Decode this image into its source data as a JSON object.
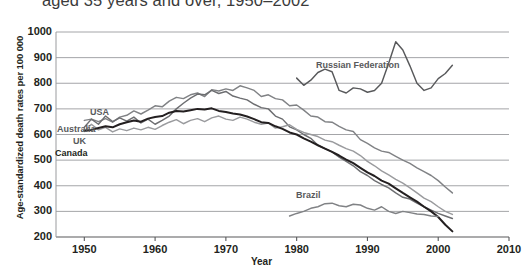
{
  "chart_data": {
    "type": "line",
    "title": "aged 35 years and over, 1950–2002",
    "xlabel": "Year",
    "ylabel": "Age-standardized death rates per 100 000",
    "xlim": [
      1946,
      2010
    ],
    "ylim": [
      200,
      1000
    ],
    "xticks": [
      1950,
      1960,
      1970,
      1980,
      1990,
      2000,
      2010
    ],
    "yticks": [
      200,
      300,
      400,
      500,
      600,
      700,
      800,
      900,
      1000
    ],
    "grid": true,
    "legend_position": "inline-annotations",
    "series": [
      {
        "name": "USA",
        "color": "#808285",
        "label_x": 90,
        "label_y": 107,
        "points": [
          [
            1950,
            655
          ],
          [
            1951,
            660
          ],
          [
            1952,
            650
          ],
          [
            1953,
            662
          ],
          [
            1954,
            648
          ],
          [
            1955,
            668
          ],
          [
            1956,
            675
          ],
          [
            1957,
            692
          ],
          [
            1958,
            680
          ],
          [
            1959,
            695
          ],
          [
            1960,
            712
          ],
          [
            1961,
            708
          ],
          [
            1962,
            730
          ],
          [
            1963,
            745
          ],
          [
            1964,
            740
          ],
          [
            1965,
            755
          ],
          [
            1966,
            762
          ],
          [
            1967,
            748
          ],
          [
            1968,
            775
          ],
          [
            1969,
            770
          ],
          [
            1970,
            778
          ],
          [
            1971,
            772
          ],
          [
            1972,
            790
          ],
          [
            1973,
            782
          ],
          [
            1974,
            772
          ],
          [
            1975,
            748
          ],
          [
            1976,
            755
          ],
          [
            1977,
            740
          ],
          [
            1978,
            735
          ],
          [
            1979,
            712
          ],
          [
            1980,
            715
          ],
          [
            1981,
            695
          ],
          [
            1982,
            672
          ],
          [
            1983,
            668
          ],
          [
            1984,
            650
          ],
          [
            1985,
            648
          ],
          [
            1986,
            632
          ],
          [
            1987,
            618
          ],
          [
            1988,
            612
          ],
          [
            1989,
            580
          ],
          [
            1990,
            565
          ],
          [
            1991,
            548
          ],
          [
            1992,
            535
          ],
          [
            1993,
            530
          ],
          [
            1994,
            515
          ],
          [
            1995,
            500
          ],
          [
            1996,
            487
          ],
          [
            1997,
            470
          ],
          [
            1998,
            455
          ],
          [
            1999,
            440
          ],
          [
            2000,
            420
          ],
          [
            2001,
            395
          ],
          [
            2002,
            372
          ]
        ]
      },
      {
        "name": "Australia",
        "color": "#6d6e71",
        "label_x": 57,
        "label_y": 124,
        "points": [
          [
            1950,
            628
          ],
          [
            1951,
            660
          ],
          [
            1952,
            640
          ],
          [
            1953,
            672
          ],
          [
            1954,
            650
          ],
          [
            1955,
            665
          ],
          [
            1956,
            652
          ],
          [
            1957,
            668
          ],
          [
            1958,
            645
          ],
          [
            1959,
            660
          ],
          [
            1960,
            640
          ],
          [
            1961,
            655
          ],
          [
            1962,
            672
          ],
          [
            1963,
            700
          ],
          [
            1964,
            722
          ],
          [
            1965,
            742
          ],
          [
            1966,
            758
          ],
          [
            1967,
            755
          ],
          [
            1968,
            772
          ],
          [
            1969,
            760
          ],
          [
            1970,
            768
          ],
          [
            1971,
            750
          ],
          [
            1972,
            742
          ],
          [
            1973,
            735
          ],
          [
            1974,
            718
          ],
          [
            1975,
            705
          ],
          [
            1976,
            700
          ],
          [
            1977,
            672
          ],
          [
            1978,
            660
          ],
          [
            1979,
            630
          ],
          [
            1980,
            618
          ],
          [
            1981,
            600
          ],
          [
            1982,
            585
          ],
          [
            1983,
            558
          ],
          [
            1984,
            545
          ],
          [
            1985,
            532
          ],
          [
            1986,
            512
          ],
          [
            1987,
            495
          ],
          [
            1988,
            478
          ],
          [
            1989,
            455
          ],
          [
            1990,
            440
          ],
          [
            1991,
            420
          ],
          [
            1992,
            405
          ],
          [
            1993,
            392
          ],
          [
            1994,
            372
          ],
          [
            1995,
            355
          ],
          [
            1996,
            348
          ],
          [
            1997,
            332
          ],
          [
            1998,
            318
          ],
          [
            1999,
            305
          ],
          [
            2000,
            292
          ],
          [
            2001,
            282
          ],
          [
            2002,
            272
          ]
        ]
      },
      {
        "name": "UK",
        "color": "#9a9b9e",
        "label_x": 73,
        "label_y": 136,
        "points": [
          [
            1950,
            612
          ],
          [
            1951,
            640
          ],
          [
            1952,
            618
          ],
          [
            1953,
            628
          ],
          [
            1954,
            610
          ],
          [
            1955,
            622
          ],
          [
            1956,
            615
          ],
          [
            1957,
            625
          ],
          [
            1958,
            618
          ],
          [
            1959,
            628
          ],
          [
            1960,
            620
          ],
          [
            1961,
            635
          ],
          [
            1962,
            648
          ],
          [
            1963,
            658
          ],
          [
            1964,
            642
          ],
          [
            1965,
            655
          ],
          [
            1966,
            662
          ],
          [
            1967,
            650
          ],
          [
            1968,
            665
          ],
          [
            1969,
            672
          ],
          [
            1970,
            660
          ],
          [
            1971,
            655
          ],
          [
            1972,
            668
          ],
          [
            1973,
            660
          ],
          [
            1974,
            648
          ],
          [
            1975,
            640
          ],
          [
            1976,
            645
          ],
          [
            1977,
            625
          ],
          [
            1978,
            630
          ],
          [
            1979,
            638
          ],
          [
            1980,
            620
          ],
          [
            1981,
            608
          ],
          [
            1982,
            600
          ],
          [
            1983,
            592
          ],
          [
            1984,
            578
          ],
          [
            1985,
            572
          ],
          [
            1986,
            558
          ],
          [
            1987,
            545
          ],
          [
            1988,
            535
          ],
          [
            1989,
            518
          ],
          [
            1990,
            495
          ],
          [
            1991,
            478
          ],
          [
            1992,
            458
          ],
          [
            1993,
            442
          ],
          [
            1994,
            425
          ],
          [
            1995,
            410
          ],
          [
            1996,
            392
          ],
          [
            1997,
            372
          ],
          [
            1998,
            352
          ],
          [
            1999,
            338
          ],
          [
            2000,
            318
          ],
          [
            2001,
            300
          ],
          [
            2002,
            288
          ]
        ]
      },
      {
        "name": "Canada",
        "color": "#231f20",
        "label_x": 55,
        "label_y": 148,
        "points": [
          [
            1950,
            615
          ],
          [
            1951,
            618
          ],
          [
            1952,
            625
          ],
          [
            1953,
            632
          ],
          [
            1954,
            628
          ],
          [
            1955,
            640
          ],
          [
            1956,
            648
          ],
          [
            1957,
            655
          ],
          [
            1958,
            650
          ],
          [
            1959,
            662
          ],
          [
            1960,
            668
          ],
          [
            1961,
            672
          ],
          [
            1962,
            685
          ],
          [
            1963,
            692
          ],
          [
            1964,
            690
          ],
          [
            1965,
            695
          ],
          [
            1966,
            700
          ],
          [
            1967,
            698
          ],
          [
            1968,
            702
          ],
          [
            1969,
            692
          ],
          [
            1970,
            688
          ],
          [
            1971,
            682
          ],
          [
            1972,
            678
          ],
          [
            1973,
            670
          ],
          [
            1974,
            660
          ],
          [
            1975,
            648
          ],
          [
            1976,
            645
          ],
          [
            1977,
            632
          ],
          [
            1978,
            622
          ],
          [
            1979,
            608
          ],
          [
            1980,
            600
          ],
          [
            1981,
            585
          ],
          [
            1982,
            572
          ],
          [
            1983,
            558
          ],
          [
            1984,
            545
          ],
          [
            1985,
            532
          ],
          [
            1986,
            518
          ],
          [
            1987,
            502
          ],
          [
            1988,
            488
          ],
          [
            1989,
            470
          ],
          [
            1990,
            452
          ],
          [
            1991,
            438
          ],
          [
            1992,
            420
          ],
          [
            1993,
            408
          ],
          [
            1994,
            390
          ],
          [
            1995,
            372
          ],
          [
            1996,
            355
          ],
          [
            1997,
            338
          ],
          [
            1998,
            318
          ],
          [
            1999,
            300
          ],
          [
            2000,
            278
          ],
          [
            2001,
            248
          ],
          [
            2002,
            222
          ]
        ]
      },
      {
        "name": "Russian Federation",
        "color": "#58595b",
        "label_x": 316,
        "label_y": 60,
        "points": [
          [
            1980,
            820
          ],
          [
            1981,
            792
          ],
          [
            1982,
            812
          ],
          [
            1983,
            842
          ],
          [
            1984,
            855
          ],
          [
            1985,
            845
          ],
          [
            1986,
            772
          ],
          [
            1987,
            762
          ],
          [
            1988,
            782
          ],
          [
            1989,
            778
          ],
          [
            1990,
            765
          ],
          [
            1991,
            772
          ],
          [
            1992,
            800
          ],
          [
            1993,
            878
          ],
          [
            1994,
            962
          ],
          [
            1995,
            930
          ],
          [
            1996,
            868
          ],
          [
            1997,
            800
          ],
          [
            1998,
            772
          ],
          [
            1999,
            782
          ],
          [
            2000,
            818
          ],
          [
            2001,
            838
          ],
          [
            2002,
            870
          ]
        ]
      },
      {
        "name": "Brazil",
        "color": "#808285",
        "label_x": 296,
        "label_y": 190,
        "points": [
          [
            1979,
            282
          ],
          [
            1980,
            292
          ],
          [
            1981,
            300
          ],
          [
            1982,
            312
          ],
          [
            1983,
            318
          ],
          [
            1984,
            330
          ],
          [
            1985,
            332
          ],
          [
            1986,
            322
          ],
          [
            1987,
            318
          ],
          [
            1988,
            328
          ],
          [
            1989,
            325
          ],
          [
            1990,
            312
          ],
          [
            1991,
            305
          ],
          [
            1992,
            318
          ],
          [
            1993,
            300
          ],
          [
            1994,
            292
          ],
          [
            1995,
            300
          ],
          [
            1996,
            295
          ],
          [
            1997,
            290
          ],
          [
            1998,
            288
          ],
          [
            1999,
            282
          ],
          [
            2000,
            280
          ]
        ]
      }
    ]
  },
  "axis": {
    "y_title": "Age-standardized death rates per 100 000",
    "x_title": "Year",
    "y_labels": [
      "1000",
      "900",
      "800",
      "700",
      "600",
      "500",
      "400",
      "300",
      "200"
    ],
    "x_labels": [
      "1950",
      "1960",
      "1970",
      "1980",
      "1990",
      "2000",
      "2010"
    ]
  },
  "labels": {
    "usa": "USA",
    "australia": "Australia",
    "uk": "UK",
    "canada": "Canada",
    "russian_federation": "Russian Federation",
    "brazil": "Brazil"
  },
  "title": "aged 35 years and over, 1950–2002"
}
